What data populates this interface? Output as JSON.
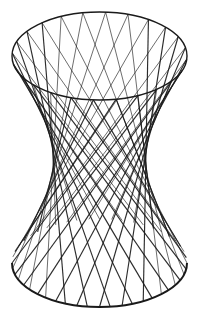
{
  "figure": {
    "title": "",
    "stroke_color": "#1a1a1a",
    "background": "#ffffff"
  },
  "geometry": {
    "center_x": 99.5,
    "top_y": 56,
    "bottom_y": 263,
    "radius_x": 87.5,
    "radius_y": 44,
    "twist_deg": 116,
    "lines_per_family": 24
  }
}
